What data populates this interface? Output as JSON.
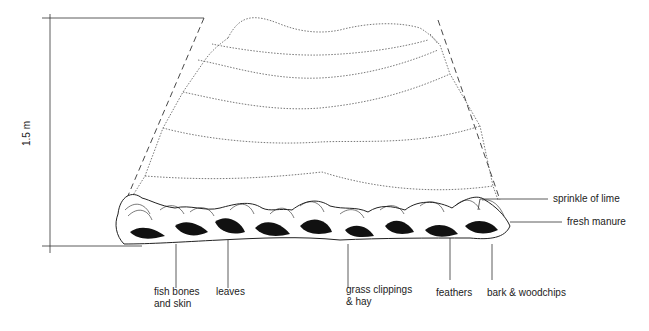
{
  "diagram": {
    "dimension": {
      "label": "1.5 m",
      "orientation": "vertical"
    },
    "labels": {
      "fish_bones": [
        "fish bones",
        "and skin"
      ],
      "leaves": "leaves",
      "grass": [
        "grass clippings",
        "& hay"
      ],
      "feathers": "feathers",
      "bark": "bark & woodchips",
      "lime": "sprinkle of lime",
      "manure": "fresh manure"
    },
    "layers_above_base": 6,
    "colors": {
      "ink": "#222222",
      "background": "#ffffff"
    }
  }
}
